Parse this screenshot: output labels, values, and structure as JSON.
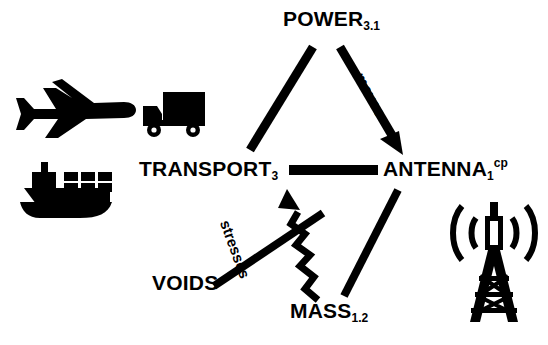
{
  "diagram": {
    "type": "node-link concept diagram",
    "background_color": "#ffffff",
    "stroke_color": "#000000",
    "nodes": [
      {
        "id": "power",
        "name": "POWER",
        "subscript": "3.1",
        "superscript": "",
        "x": 340,
        "y": 18
      },
      {
        "id": "transport",
        "name": "TRANSPORT",
        "subscript": "3",
        "superscript": "",
        "x": 213,
        "y": 168
      },
      {
        "id": "antenna",
        "name": "ANTENNA",
        "subscript": "1",
        "superscript": "cp",
        "x": 446,
        "y": 168
      },
      {
        "id": "mass",
        "name": "MASS",
        "subscript": "1.2",
        "superscript": "",
        "x": 330,
        "y": 310
      },
      {
        "id": "voids",
        "name": "VOIDS",
        "subscript": "",
        "superscript": "",
        "x": 186,
        "y": 282
      }
    ],
    "edges": [
      {
        "id": "power-transport",
        "from": "power",
        "to": "transport",
        "label": "",
        "style": "straight",
        "arrow": false
      },
      {
        "id": "power-antenna",
        "from": "power",
        "to": "antenna",
        "label": "moves",
        "style": "straight",
        "arrow": true
      },
      {
        "id": "transport-antenna",
        "from": "transport",
        "to": "antenna",
        "label": "",
        "style": "straight",
        "arrow": false
      },
      {
        "id": "mass-antenna",
        "from": "mass",
        "to": "antenna",
        "label": "",
        "style": "straight",
        "arrow": false
      },
      {
        "id": "mass-transport",
        "from": "mass",
        "to": "transport",
        "label": "",
        "style": "zigzag",
        "arrow": true
      },
      {
        "id": "voids-edge",
        "from": "voids",
        "to": "",
        "label": "stresses",
        "style": "straight",
        "arrow": false
      }
    ],
    "edge_labels": {
      "moves": "moves",
      "stresses": "stresses"
    },
    "icons": [
      {
        "id": "airplane",
        "name": "airplane-icon",
        "associated_node": "transport"
      },
      {
        "id": "truck",
        "name": "delivery-truck-icon",
        "associated_node": "transport"
      },
      {
        "id": "ship",
        "name": "container-ship-icon",
        "associated_node": "transport"
      },
      {
        "id": "tower",
        "name": "broadcast-tower-icon",
        "associated_node": "antenna"
      }
    ]
  }
}
